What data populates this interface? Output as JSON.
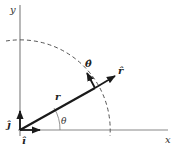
{
  "diagram": {
    "type": "polar-unit-vectors",
    "axes": {
      "x_label": "x",
      "y_label": "y"
    },
    "vectors": {
      "position": {
        "label": "r"
      },
      "r_hat": {
        "label": "r̂"
      },
      "theta_hat": {
        "label": "θ̂"
      },
      "i_hat": {
        "label": "î"
      },
      "j_hat": {
        "label": "ĵ"
      }
    },
    "angle": {
      "label": "θ"
    },
    "colors": {
      "axis": "#888888",
      "vector": "#1a1a1a",
      "dashed_arc": "#555555",
      "background": "#ffffff"
    }
  }
}
